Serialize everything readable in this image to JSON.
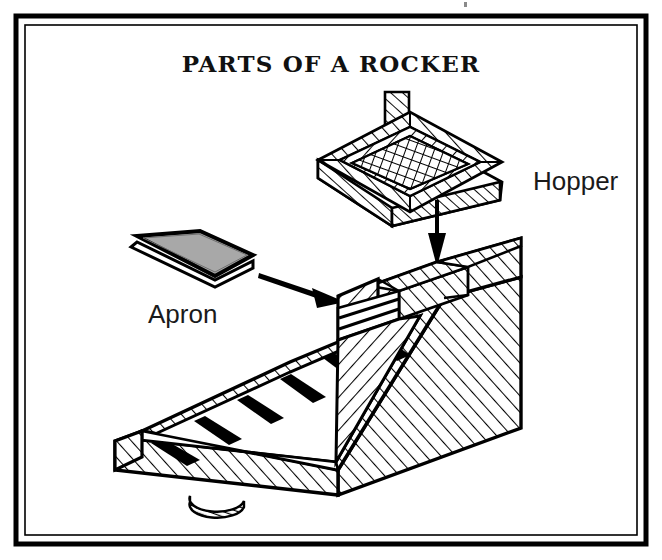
{
  "figure": {
    "title": "PARTS OF A ROCKER",
    "frame": {
      "outer_color": "#000000",
      "inner_color": "#000000",
      "background": "#ffffff"
    },
    "labels": [
      {
        "id": "hopper",
        "text": "Hopper",
        "x": 533,
        "y": 190
      },
      {
        "id": "apron",
        "text": "Apron",
        "x": 148,
        "y": 323
      }
    ],
    "arrows": [
      {
        "id": "apron-arrow",
        "points_to": "rocker-body-front-box",
        "direction": "right-down"
      },
      {
        "id": "hopper-arrow",
        "points_to": "rocker-body-back-box",
        "direction": "down"
      }
    ],
    "parts": [
      {
        "id": "hopper",
        "name": "Hopper",
        "description": "Open rectangular screen tray with hatched wooden walls, cross-hatched wire mesh bottom and a vertical handle post",
        "fill": "#ffffff",
        "hatch": "diagonal",
        "screen": "cross-hatch-mesh"
      },
      {
        "id": "apron",
        "name": "Apron",
        "description": "Flat canvas-covered sloping board slab shown detached",
        "fill": "#a8a8a8",
        "edge": "#000000"
      },
      {
        "id": "rocker-body",
        "name": "Rocker body",
        "description": "Sluice box on rocker feet with riffle bars on the sloping floor and an open hatched box at the upper end",
        "fill": "#ffffff",
        "hatch": "diagonal",
        "riffle_bar_count": 6,
        "rocker_feet_count": 2
      }
    ],
    "colors": {
      "ink": "#000000",
      "paper": "#ffffff",
      "apron_gray": "#a8a8a8"
    }
  }
}
